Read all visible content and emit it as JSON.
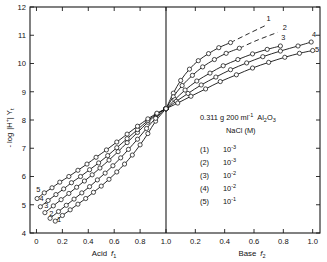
{
  "chart_data": {
    "type": "line",
    "title": "",
    "xlabel_left": "Acid f1",
    "xlabel_right": "Base f2",
    "ylabel": "- log |H+| Yt",
    "ylim": [
      4,
      12
    ],
    "yticks": [
      4,
      5,
      6,
      7,
      8,
      9,
      10,
      11,
      12
    ],
    "xticks_left": [
      0,
      0.2,
      0.4,
      0.6,
      0.8,
      1.0
    ],
    "xticks_right": [
      0.2,
      0.4,
      0.6,
      0.8,
      1.0
    ],
    "xlim_left": [
      -0.05,
      1.0
    ],
    "xlim_right": [
      0.0,
      1.05
    ],
    "grid": false,
    "legend_position": "center-right",
    "intersection_point": {
      "x": 1.0,
      "y": 8.4
    },
    "series": [
      {
        "name": "(1)",
        "label": "1",
        "concentration": "10-3",
        "left_points": [
          {
            "x": 0.145,
            "y": 4.42
          },
          {
            "x": 0.2,
            "y": 4.62
          },
          {
            "x": 0.26,
            "y": 4.82
          },
          {
            "x": 0.32,
            "y": 5.02
          },
          {
            "x": 0.38,
            "y": 5.22
          },
          {
            "x": 0.44,
            "y": 5.44
          },
          {
            "x": 0.5,
            "y": 5.66
          },
          {
            "x": 0.56,
            "y": 5.9
          },
          {
            "x": 0.62,
            "y": 6.16
          },
          {
            "x": 0.68,
            "y": 6.44
          },
          {
            "x": 0.74,
            "y": 6.76
          },
          {
            "x": 0.8,
            "y": 7.12
          },
          {
            "x": 0.86,
            "y": 7.52
          },
          {
            "x": 0.92,
            "y": 7.96
          },
          {
            "x": 1.0,
            "y": 8.4
          }
        ],
        "right_points": [
          {
            "x": 0.0,
            "y": 8.4
          },
          {
            "x": 0.05,
            "y": 8.95
          },
          {
            "x": 0.1,
            "y": 9.4
          },
          {
            "x": 0.16,
            "y": 9.8
          },
          {
            "x": 0.22,
            "y": 10.1
          },
          {
            "x": 0.29,
            "y": 10.35
          },
          {
            "x": 0.36,
            "y": 10.56
          },
          {
            "x": 0.44,
            "y": 10.74
          }
        ],
        "dashed_points": [
          {
            "x": 0.44,
            "y": 10.74
          },
          {
            "x": 0.56,
            "y": 11.05
          },
          {
            "x": 0.68,
            "y": 11.35
          }
        ],
        "label_pos": {
          "x": 0.7,
          "y": 11.52
        }
      },
      {
        "name": "(2)",
        "label": "2",
        "concentration": "10-3",
        "left_points": [
          {
            "x": 0.105,
            "y": 4.52
          },
          {
            "x": 0.17,
            "y": 4.76
          },
          {
            "x": 0.23,
            "y": 4.98
          },
          {
            "x": 0.29,
            "y": 5.2
          },
          {
            "x": 0.35,
            "y": 5.42
          },
          {
            "x": 0.41,
            "y": 5.64
          },
          {
            "x": 0.47,
            "y": 5.88
          },
          {
            "x": 0.53,
            "y": 6.12
          },
          {
            "x": 0.59,
            "y": 6.38
          },
          {
            "x": 0.65,
            "y": 6.66
          },
          {
            "x": 0.71,
            "y": 6.96
          },
          {
            "x": 0.78,
            "y": 7.32
          },
          {
            "x": 0.85,
            "y": 7.7
          },
          {
            "x": 0.92,
            "y": 8.06
          },
          {
            "x": 1.0,
            "y": 8.4
          }
        ],
        "right_points": [
          {
            "x": 0.0,
            "y": 8.4
          },
          {
            "x": 0.05,
            "y": 8.82
          },
          {
            "x": 0.11,
            "y": 9.22
          },
          {
            "x": 0.18,
            "y": 9.58
          },
          {
            "x": 0.25,
            "y": 9.88
          },
          {
            "x": 0.33,
            "y": 10.14
          },
          {
            "x": 0.41,
            "y": 10.36
          },
          {
            "x": 0.5,
            "y": 10.54
          }
        ],
        "dashed_points": [
          {
            "x": 0.5,
            "y": 10.54
          },
          {
            "x": 0.62,
            "y": 10.82
          },
          {
            "x": 0.76,
            "y": 11.1
          }
        ],
        "label_pos": {
          "x": 0.81,
          "y": 11.18
        }
      },
      {
        "name": "(3)",
        "label": "3",
        "concentration": "10-2",
        "left_points": [
          {
            "x": 0.065,
            "y": 4.72
          },
          {
            "x": 0.13,
            "y": 4.96
          },
          {
            "x": 0.19,
            "y": 5.18
          },
          {
            "x": 0.25,
            "y": 5.4
          },
          {
            "x": 0.31,
            "y": 5.62
          },
          {
            "x": 0.37,
            "y": 5.84
          },
          {
            "x": 0.43,
            "y": 6.06
          },
          {
            "x": 0.49,
            "y": 6.3
          },
          {
            "x": 0.56,
            "y": 6.58
          },
          {
            "x": 0.63,
            "y": 6.88
          },
          {
            "x": 0.7,
            "y": 7.2
          },
          {
            "x": 0.78,
            "y": 7.56
          },
          {
            "x": 0.86,
            "y": 7.92
          },
          {
            "x": 0.93,
            "y": 8.2
          },
          {
            "x": 1.0,
            "y": 8.4
          }
        ],
        "right_points": [
          {
            "x": 0.0,
            "y": 8.4
          },
          {
            "x": 0.06,
            "y": 8.72
          },
          {
            "x": 0.13,
            "y": 9.06
          },
          {
            "x": 0.21,
            "y": 9.38
          },
          {
            "x": 0.3,
            "y": 9.66
          },
          {
            "x": 0.39,
            "y": 9.92
          },
          {
            "x": 0.49,
            "y": 10.14
          },
          {
            "x": 0.59,
            "y": 10.34
          },
          {
            "x": 0.69,
            "y": 10.5
          },
          {
            "x": 0.78,
            "y": 10.62
          }
        ],
        "dashed_points": [],
        "label_pos": {
          "x": 0.8,
          "y": 10.82
        }
      },
      {
        "name": "(4)",
        "label": "4",
        "concentration": "10-2",
        "left_points": [
          {
            "x": 0.03,
            "y": 4.93
          },
          {
            "x": 0.09,
            "y": 5.15
          },
          {
            "x": 0.15,
            "y": 5.36
          },
          {
            "x": 0.21,
            "y": 5.56
          },
          {
            "x": 0.27,
            "y": 5.78
          },
          {
            "x": 0.34,
            "y": 6.0
          },
          {
            "x": 0.41,
            "y": 6.24
          },
          {
            "x": 0.48,
            "y": 6.48
          },
          {
            "x": 0.55,
            "y": 6.74
          },
          {
            "x": 0.62,
            "y": 7.02
          },
          {
            "x": 0.7,
            "y": 7.34
          },
          {
            "x": 0.78,
            "y": 7.66
          },
          {
            "x": 0.86,
            "y": 7.98
          },
          {
            "x": 0.93,
            "y": 8.22
          },
          {
            "x": 1.0,
            "y": 8.4
          }
        ],
        "right_points": [
          {
            "x": 0.0,
            "y": 8.4
          },
          {
            "x": 0.07,
            "y": 8.66
          },
          {
            "x": 0.15,
            "y": 8.94
          },
          {
            "x": 0.24,
            "y": 9.24
          },
          {
            "x": 0.34,
            "y": 9.52
          },
          {
            "x": 0.44,
            "y": 9.78
          },
          {
            "x": 0.55,
            "y": 10.02
          },
          {
            "x": 0.66,
            "y": 10.24
          },
          {
            "x": 0.78,
            "y": 10.44
          },
          {
            "x": 0.9,
            "y": 10.62
          },
          {
            "x": 0.99,
            "y": 10.76
          }
        ],
        "dashed_points": [],
        "label_pos": {
          "x": 1.01,
          "y": 10.95
        }
      },
      {
        "name": "(5)",
        "label": "5",
        "concentration": "10-1",
        "left_points": [
          {
            "x": 0.005,
            "y": 5.22
          },
          {
            "x": 0.06,
            "y": 5.42
          },
          {
            "x": 0.12,
            "y": 5.6
          },
          {
            "x": 0.18,
            "y": 5.8
          },
          {
            "x": 0.25,
            "y": 6.0
          },
          {
            "x": 0.32,
            "y": 6.22
          },
          {
            "x": 0.39,
            "y": 6.44
          },
          {
            "x": 0.46,
            "y": 6.68
          },
          {
            "x": 0.54,
            "y": 6.94
          },
          {
            "x": 0.62,
            "y": 7.22
          },
          {
            "x": 0.7,
            "y": 7.5
          },
          {
            "x": 0.78,
            "y": 7.78
          },
          {
            "x": 0.86,
            "y": 8.04
          },
          {
            "x": 0.93,
            "y": 8.24
          },
          {
            "x": 1.0,
            "y": 8.4
          }
        ],
        "right_points": [
          {
            "x": 0.0,
            "y": 8.4
          },
          {
            "x": 0.08,
            "y": 8.6
          },
          {
            "x": 0.17,
            "y": 8.84
          },
          {
            "x": 0.27,
            "y": 9.1
          },
          {
            "x": 0.37,
            "y": 9.36
          },
          {
            "x": 0.48,
            "y": 9.6
          },
          {
            "x": 0.59,
            "y": 9.84
          },
          {
            "x": 0.7,
            "y": 10.04
          },
          {
            "x": 0.81,
            "y": 10.22
          },
          {
            "x": 0.91,
            "y": 10.36
          },
          {
            "x": 1.0,
            "y": 10.46
          }
        ],
        "dashed_points": [],
        "label_pos": {
          "x": 1.03,
          "y": 10.4
        }
      }
    ],
    "left_curve_labels": [
      {
        "label": "5",
        "x": 0.015,
        "y": 5.45
      },
      {
        "label": "4",
        "x": 0.04,
        "y": 5.13
      },
      {
        "label": "3",
        "x": 0.075,
        "y": 4.87
      },
      {
        "label": "2",
        "x": 0.115,
        "y": 4.6
      },
      {
        "label": "1",
        "x": 0.175,
        "y": 4.4
      }
    ]
  },
  "annotation": {
    "line1_prefix": "0.311 g  200 ml",
    "line1_exp": "-1",
    "line1_compound_a": "Al",
    "line1_compound_sub1": "2",
    "line1_compound_b": "O",
    "line1_compound_sub2": "3",
    "line2": "NaCl (M)",
    "rows": [
      {
        "index": "(1)",
        "base": "10",
        "exp": "-3"
      },
      {
        "index": "(2)",
        "base": "10",
        "exp": "-3"
      },
      {
        "index": "(3)",
        "base": "10",
        "exp": "-2"
      },
      {
        "index": "(4)",
        "base": "10",
        "exp": "-2"
      },
      {
        "index": "(5)",
        "base": "10",
        "exp": "-1"
      }
    ]
  },
  "axes": {
    "y_label_minus": "-",
    "y_label_log": "log",
    "y_label_h": "|H",
    "y_label_plus": "+",
    "y_label_bar": "|",
    "y_label_y": "Y",
    "y_label_t": "t",
    "x_left_label": "Acid",
    "x_left_sym": "f",
    "x_left_sub": "1",
    "x_right_label": "Base",
    "x_right_sym": "f",
    "x_right_sub": "2"
  },
  "colors": {
    "ink": "#111111",
    "background": "#ffffff"
  }
}
